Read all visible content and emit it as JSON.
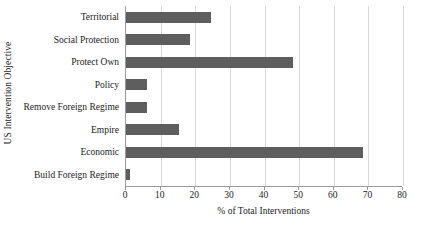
{
  "chart_data": {
    "type": "bar",
    "orientation": "horizontal",
    "title": "",
    "xlabel": "% of Total Interventions",
    "ylabel": "US Intervention Objective",
    "categories": [
      "Territorial",
      "Social Protection",
      "Protect Own",
      "Policy",
      "Remove Foreign Regime",
      "Empire",
      "Economic",
      "Build Foreign Regime"
    ],
    "values": [
      24.6,
      18.5,
      48.1,
      6.1,
      6.1,
      15.4,
      68.4,
      1.2
    ],
    "xlim": [
      0,
      80
    ],
    "xticks": [
      0,
      10,
      20,
      30,
      40,
      50,
      60,
      70,
      80
    ],
    "xtick_labels": [
      "0",
      "10",
      "20",
      "30",
      "40",
      "50",
      "60",
      "70",
      "80"
    ],
    "grid": "vertical",
    "legend": "none",
    "bar_color": "#5e5e5e",
    "gridline_color": "#d9d9d9",
    "axis_color": "#9a9a9a",
    "background_color": "#ffffff"
  }
}
